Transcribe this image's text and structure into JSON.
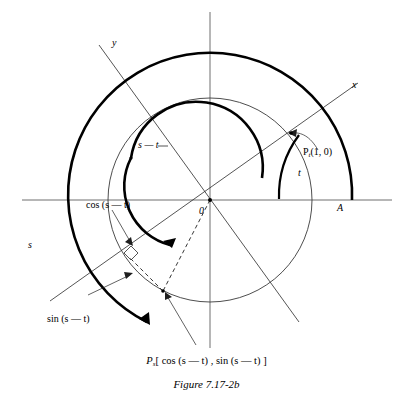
{
  "figure": {
    "caption": "Figure 7.17-2b",
    "point_expression_prefix": "P",
    "point_expression_sub": "s",
    "point_expression_rest": "[ cos (s — t) , sin (s — t) ]",
    "axis_labels": {
      "x_rotated": "x",
      "y_rotated": "y"
    },
    "origin_label": "0",
    "point_a_label": "A",
    "arc_label_s": "s",
    "arc_label_t": "t",
    "arc_label_s_minus_t": "s — t",
    "cos_label": "cos (s — t)",
    "sin_label": "sin (s — t)",
    "pt_label_prefix": "P",
    "pt_label_sub": "t",
    "pt_label_rest": "(1, 0)",
    "colors": {
      "ink": "#000000",
      "axis_gray": "#6f6f6f",
      "paper": "#ffffff"
    }
  }
}
